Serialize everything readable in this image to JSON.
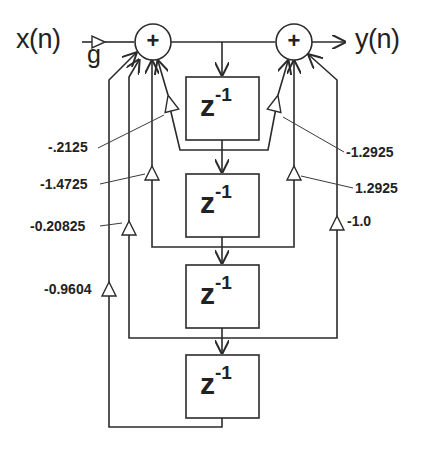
{
  "diagram": {
    "type": "IIR filter block diagram (direct form, 4th order)",
    "input_label": "x(n)",
    "output_label": "y(n)",
    "input_gain_label": "g",
    "summing_junctions": [
      {
        "id": "sum-left",
        "symbol": "+"
      },
      {
        "id": "sum-right",
        "symbol": "+"
      }
    ],
    "delay_blocks": [
      {
        "id": "delay-1",
        "base": "z",
        "exponent": "-1"
      },
      {
        "id": "delay-2",
        "base": "z",
        "exponent": "-1"
      },
      {
        "id": "delay-3",
        "base": "z",
        "exponent": "-1"
      },
      {
        "id": "delay-4",
        "base": "z",
        "exponent": "-1"
      }
    ],
    "feedback_coefficients": [
      {
        "label": "-.2125",
        "tap": 1
      },
      {
        "label": "-1.4725",
        "tap": 2
      },
      {
        "label": "-0.20825",
        "tap": 3
      },
      {
        "label": "-0.9604",
        "tap": 4
      }
    ],
    "feedforward_coefficients": [
      {
        "label": "-1.2925",
        "tap": 1
      },
      {
        "label": "1.2925",
        "tap": 2
      },
      {
        "label": "-1.0",
        "tap": 3
      }
    ],
    "colors": {
      "line": "#2b2b2b",
      "background": "#ffffff",
      "text": "#222222"
    }
  }
}
